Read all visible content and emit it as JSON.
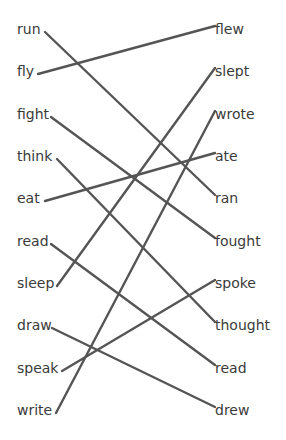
{
  "diagram": {
    "title": "",
    "line_color": "#555555",
    "text_color": "#3a3a3a",
    "left": [
      {
        "label": "run",
        "y": 30,
        "end_x": 45
      },
      {
        "label": "fly",
        "y": 72,
        "end_x": 38
      },
      {
        "label": "fight",
        "y": 115,
        "end_x": 51
      },
      {
        "label": "think",
        "y": 157,
        "end_x": 57
      },
      {
        "label": "eat",
        "y": 199,
        "end_x": 45
      },
      {
        "label": "read",
        "y": 242,
        "end_x": 51
      },
      {
        "label": "sleep",
        "y": 284,
        "end_x": 57
      },
      {
        "label": "draw",
        "y": 326,
        "end_x": 52
      },
      {
        "label": "speak",
        "y": 369,
        "end_x": 62
      },
      {
        "label": "write",
        "y": 411,
        "end_x": 56
      }
    ],
    "right": [
      {
        "label": "flew",
        "y": 30,
        "start_x": 215
      },
      {
        "label": "slept",
        "y": 72,
        "start_x": 215
      },
      {
        "label": "wrote",
        "y": 115,
        "start_x": 215
      },
      {
        "label": "ate",
        "y": 157,
        "start_x": 215
      },
      {
        "label": "ran",
        "y": 199,
        "start_x": 215
      },
      {
        "label": "fought",
        "y": 242,
        "start_x": 215
      },
      {
        "label": "spoke",
        "y": 284,
        "start_x": 215
      },
      {
        "label": "thought",
        "y": 326,
        "start_x": 215
      },
      {
        "label": "read",
        "y": 369,
        "start_x": 215
      },
      {
        "label": "drew",
        "y": 411,
        "start_x": 215
      }
    ],
    "connections": [
      {
        "from": 0,
        "to": 4
      },
      {
        "from": 1,
        "to": 0
      },
      {
        "from": 2,
        "to": 5
      },
      {
        "from": 3,
        "to": 7
      },
      {
        "from": 4,
        "to": 3
      },
      {
        "from": 5,
        "to": 8
      },
      {
        "from": 6,
        "to": 1
      },
      {
        "from": 7,
        "to": 9
      },
      {
        "from": 8,
        "to": 6
      },
      {
        "from": 9,
        "to": 2
      }
    ]
  }
}
